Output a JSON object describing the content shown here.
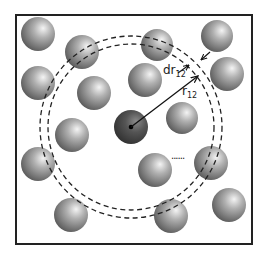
{
  "diagram": {
    "frame": {
      "x": 16,
      "y": 15,
      "width": 236,
      "height": 229
    },
    "reference_particle": {
      "cx": 131,
      "cy": 127,
      "r": 17,
      "color": "#3a3a3a"
    },
    "shell": {
      "cx": 131,
      "cy": 127,
      "inner_radius": 83,
      "outer_radius": 91
    },
    "particles": [
      {
        "cx": 38,
        "cy": 34,
        "r": 17
      },
      {
        "cx": 82,
        "cy": 52,
        "r": 17
      },
      {
        "cx": 157,
        "cy": 45,
        "r": 16
      },
      {
        "cx": 217,
        "cy": 36,
        "r": 16
      },
      {
        "cx": 38,
        "cy": 83,
        "r": 17
      },
      {
        "cx": 227,
        "cy": 74,
        "r": 17
      },
      {
        "cx": 94,
        "cy": 93,
        "r": 17
      },
      {
        "cx": 145,
        "cy": 80,
        "r": 17
      },
      {
        "cx": 182,
        "cy": 118,
        "r": 16
      },
      {
        "cx": 72,
        "cy": 135,
        "r": 17
      },
      {
        "cx": 38,
        "cy": 164,
        "r": 17
      },
      {
        "cx": 155,
        "cy": 170,
        "r": 17
      },
      {
        "cx": 211,
        "cy": 163,
        "r": 17
      },
      {
        "cx": 71,
        "cy": 215,
        "r": 17
      },
      {
        "cx": 171,
        "cy": 216,
        "r": 17
      },
      {
        "cx": 229,
        "cy": 205,
        "r": 17
      }
    ],
    "labels": {
      "dr": "dr",
      "dr_sub": "12",
      "r": "r",
      "r_sub": "12"
    },
    "ellipsis": "......"
  }
}
